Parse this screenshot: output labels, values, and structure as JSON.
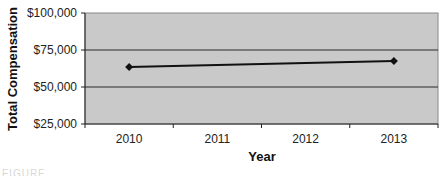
{
  "chart_data": {
    "type": "line",
    "title": "",
    "xlabel": "Year",
    "ylabel": "Total Compensation",
    "categories": [
      "2010",
      "2011",
      "2012",
      "2013"
    ],
    "series": [
      {
        "name": "Total Compensation",
        "x": [
          "2010",
          "2013"
        ],
        "values": [
          63500,
          67500
        ],
        "marker": "diamond",
        "color": "#111111"
      }
    ],
    "ylim": [
      25000,
      100000
    ],
    "yticks": [
      25000,
      50000,
      75000,
      100000
    ],
    "ytick_labels": [
      "$25,000",
      "$50,000",
      "$75,000",
      "$100,000"
    ],
    "grid": {
      "horizontal": true,
      "vertical": false
    },
    "legend": "none",
    "plot_background": "#c9c9c9"
  },
  "caption": {
    "text": "FIGURE"
  }
}
